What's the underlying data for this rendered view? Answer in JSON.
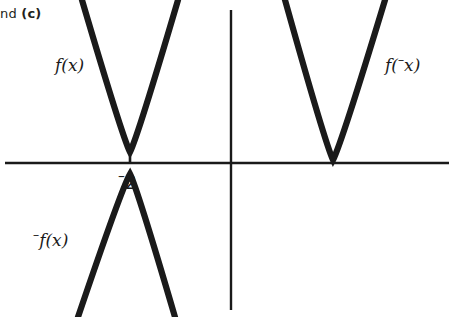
{
  "page": {
    "width": 454,
    "height": 317,
    "background": "#ffffff",
    "ink_color": "#1a1a1a",
    "partial_caption_prefix": "nd ",
    "partial_caption_bold": "(c)"
  },
  "chart_data": {
    "type": "line",
    "title": "",
    "subtitle": "",
    "xlabel": "",
    "ylabel": "",
    "grid": false,
    "legend": "inline-annotations",
    "axes": {
      "x_axis_y_px": 163,
      "y_axis_x_px": 231,
      "x_axis_extent_px": [
        5,
        449
      ],
      "y_axis_extent_px": [
        10,
        310
      ],
      "x_tick_values": [
        -2
      ],
      "x_tick_labels": [
        "⁻2"
      ],
      "origin_px": [
        231,
        163
      ]
    },
    "annotations": [
      {
        "text": "f(x)",
        "x_px": 55,
        "y_px": 70,
        "describes": "upward-parabola-left"
      },
      {
        "text": "f(⁻x)",
        "x_px": 385,
        "y_px": 70,
        "describes": "upward-parabola-right"
      },
      {
        "text": "⁻f(x)",
        "x_px": 33,
        "y_px": 245,
        "describes": "downward-parabola-left"
      },
      {
        "text": "⁻2",
        "x_px": 118,
        "y_px": 188,
        "describes": "x-intercept-tick-label"
      }
    ],
    "series": [
      {
        "name": "f(x)",
        "kind": "parabola",
        "orientation": "opens-up",
        "vertex_px": [
          130,
          152
        ],
        "vertex_data": [
          -2,
          0
        ],
        "label": "f(x)",
        "endpoints_px": [
          [
            82,
            0
          ],
          [
            178,
            0
          ]
        ]
      },
      {
        "name": "-f(x)",
        "kind": "parabola",
        "orientation": "opens-down",
        "vertex_px": [
          130,
          174
        ],
        "vertex_data": [
          -2,
          0
        ],
        "label": "⁻f(x)",
        "endpoints_px": [
          [
            78,
            317
          ],
          [
            175,
            317
          ]
        ]
      },
      {
        "name": "f(-x)",
        "kind": "parabola",
        "orientation": "opens-up",
        "vertex_px": [
          333,
          160
        ],
        "vertex_data": [
          2,
          0
        ],
        "label": "f(⁻x)",
        "endpoints_px": [
          [
            285,
            0
          ],
          [
            385,
            0
          ]
        ]
      }
    ]
  }
}
